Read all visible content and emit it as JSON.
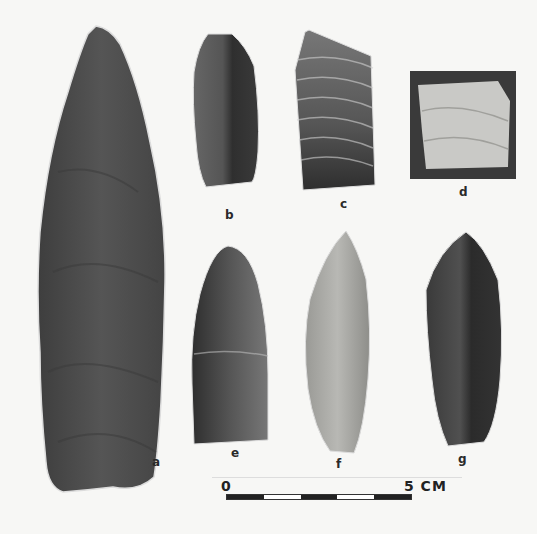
{
  "figure": {
    "background_color": "#f7f7f5"
  },
  "artifacts": [
    {
      "id": "a",
      "label": "a",
      "tone": "#4a4a4a"
    },
    {
      "id": "b",
      "label": "b",
      "tone": "#4d4d4d"
    },
    {
      "id": "c",
      "label": "c",
      "tone": "#5a5a5a"
    },
    {
      "id": "d",
      "label": "d",
      "tone": "#c9c9c6",
      "backing": "#3a3a3a"
    },
    {
      "id": "e",
      "label": "e",
      "tone": "#4b4b4b"
    },
    {
      "id": "f",
      "label": "f",
      "tone": "#a8a8a4"
    },
    {
      "id": "g",
      "label": "g",
      "tone": "#3f3f3f"
    }
  ],
  "scale": {
    "start_label": "0",
    "end_label": "5 CM",
    "segments": [
      "#222222",
      "#ffffff",
      "#222222",
      "#ffffff",
      "#222222"
    ]
  }
}
